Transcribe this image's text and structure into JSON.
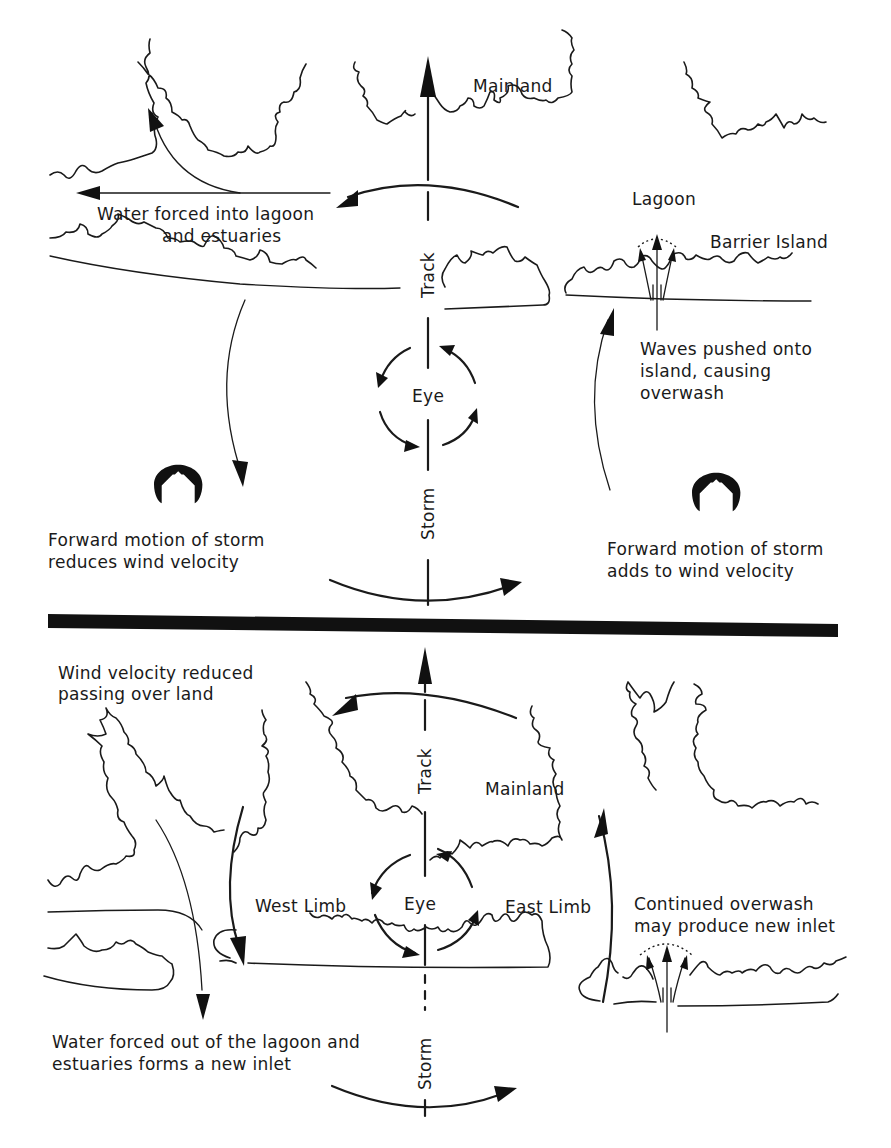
{
  "figure": {
    "top_panel": {
      "name": "storm-approach",
      "labels": {
        "mainland": "Mainland",
        "lagoon": "Lagoon",
        "barrier_island": "Barrier Island",
        "water_forced_line1": "Water forced into lagoon",
        "water_forced_line2": "and estuaries",
        "waves_line1": "Waves pushed onto",
        "waves_line2": "island, causing",
        "waves_line3": "overwash",
        "left_motion_line1": "Forward motion of storm",
        "left_motion_line2": "reduces wind velocity",
        "right_motion_line1": "Forward motion of storm",
        "right_motion_line2": "adds to wind velocity",
        "track": "Track",
        "storm": "Storm",
        "eye": "Eye"
      }
    },
    "bottom_panel": {
      "name": "storm-landfall",
      "labels": {
        "wind_reduced_line1": "Wind velocity reduced",
        "wind_reduced_line2": "passing over land",
        "mainland": "Mainland",
        "west_limb": "West Limb",
        "east_limb": "East Limb",
        "eye": "Eye",
        "track": "Track",
        "storm": "Storm",
        "continued_line1": "Continued overwash",
        "continued_line2": "may produce new inlet",
        "water_out_line1": "Water forced out of the lagoon and",
        "water_out_line2": "estuaries forms a new inlet"
      }
    },
    "icons": {
      "forward_motion_symbol": "house-arch-icon",
      "divider": "black-divider-bar"
    },
    "colors": {
      "ink": "#1a1a1a",
      "background": "#ffffff"
    }
  }
}
